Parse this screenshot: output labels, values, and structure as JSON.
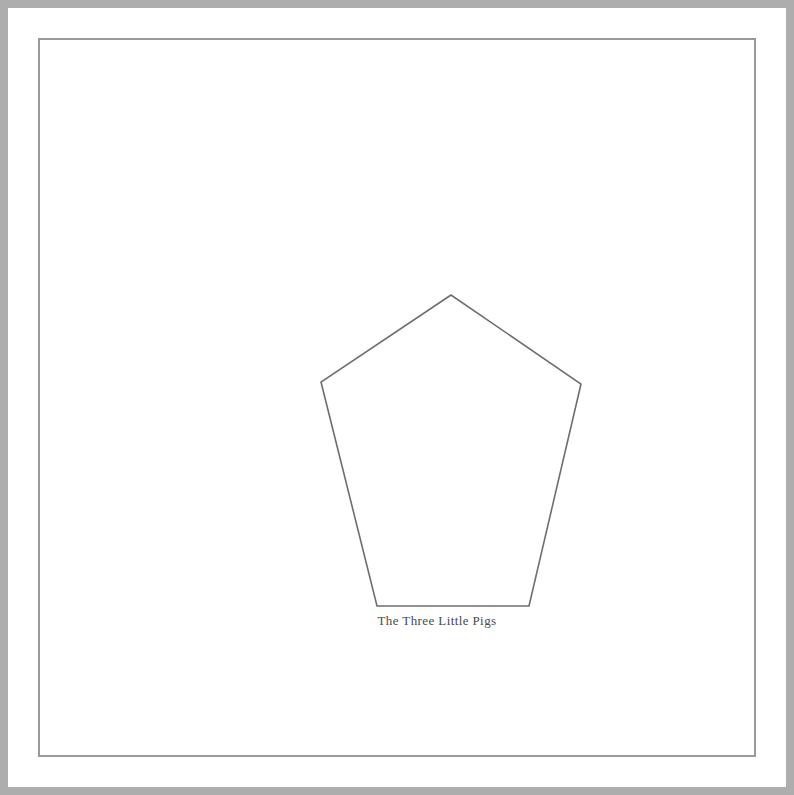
{
  "page": {
    "background_color": "#ffffff",
    "width": 794,
    "height": 795
  },
  "frame": {
    "outer_band_color": "#adadad",
    "gap_color": "#ffffff",
    "inner_rule_color": "#9a9a9a",
    "outer_band_width": 8,
    "gap_width": 6,
    "inner_rule_width": 2
  },
  "figure": {
    "caption": "The Three Little Pigs",
    "caption_color": "#4a4a4a",
    "shape": {
      "name": "pentagon",
      "sides": 5,
      "stroke_color": "#6e6e6e",
      "stroke_width": 1.6,
      "fill": "none",
      "points": "393,237 263,324 319,548 471,548 523,326",
      "vertices": [
        {
          "label": "apex",
          "x": 393,
          "y": 237
        },
        {
          "label": "left-upper",
          "x": 263,
          "y": 324
        },
        {
          "label": "left-lower",
          "x": 319,
          "y": 548
        },
        {
          "label": "right-lower",
          "x": 471,
          "y": 548
        },
        {
          "label": "right-upper",
          "x": 523,
          "y": 326
        }
      ]
    }
  }
}
